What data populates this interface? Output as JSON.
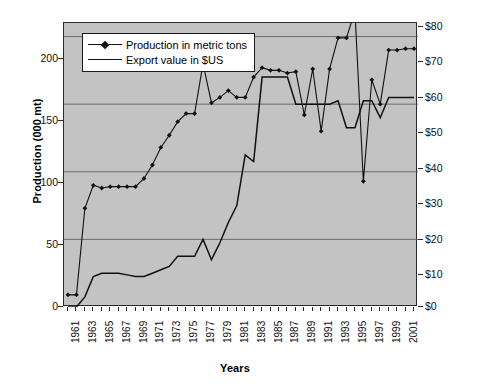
{
  "chart_data": {
    "type": "line",
    "title": "",
    "xlabel": "Years",
    "ylabel": "Production (000 mt)",
    "ylabel_right": "Export value (millions of $US)",
    "grid": true,
    "legend_position": "top-left",
    "xlim": [
      1961,
      2002
    ],
    "ylim": [
      0,
      210
    ],
    "ylim_right": [
      0,
      84
    ],
    "x": [
      1961,
      1962,
      1963,
      1964,
      1965,
      1966,
      1967,
      1968,
      1969,
      1970,
      1971,
      1972,
      1973,
      1974,
      1975,
      1976,
      1977,
      1978,
      1979,
      1980,
      1981,
      1982,
      1983,
      1984,
      1985,
      1986,
      1987,
      1988,
      1989,
      1990,
      1991,
      1992,
      1993,
      1994,
      1995,
      1996,
      1997,
      1998,
      1999,
      2000,
      2001,
      2002
    ],
    "xticks": [
      "1961",
      "1963",
      "1965",
      "1967",
      "1969",
      "1971",
      "1973",
      "1975",
      "1977",
      "1979",
      "1981",
      "1983",
      "1985",
      "1987",
      "1989",
      "1991",
      "1993",
      "1995",
      "1997",
      "1999",
      "2001"
    ],
    "yticks_left": [
      "0",
      "50",
      "100",
      "150",
      "200"
    ],
    "yticks_right": [
      "$0",
      "$10",
      "$20",
      "$30",
      "$40",
      "$50",
      "$60",
      "$70",
      "$80"
    ],
    "series": [
      {
        "name": "Production in metric tons",
        "axis": "left",
        "marker": "diamond",
        "units": "000 mt",
        "values": [
          9,
          9,
          73,
          90,
          88,
          89,
          89,
          89,
          89,
          95,
          105,
          118,
          127,
          137,
          143,
          143,
          180,
          151,
          155,
          160,
          155,
          155,
          170,
          177,
          175,
          175,
          173,
          174,
          142,
          176,
          130,
          176,
          199,
          199,
          219,
          93,
          168,
          150,
          190,
          190,
          191,
          191
        ]
      },
      {
        "name": "Export value in $US",
        "axis": "right",
        "marker": "none",
        "units": "millions of $US",
        "values": [
          0,
          0,
          3,
          9,
          10,
          10,
          10,
          9.5,
          9,
          9,
          10,
          11,
          12,
          15,
          15,
          15,
          20,
          14,
          19,
          25,
          30,
          45,
          43,
          68,
          68,
          68,
          68,
          60,
          60,
          60,
          60,
          60,
          61,
          53,
          53,
          61,
          61,
          56,
          62,
          62,
          62,
          62
        ]
      }
    ]
  },
  "legend": {
    "items": [
      {
        "label": "Production in metric tons",
        "key": "line-with-diamond-marker"
      },
      {
        "label": "Export value in $US",
        "key": "plain-line"
      }
    ]
  },
  "axes": {
    "left_title": "Production (000 mt)",
    "right_title": "Export value (millions of $US)",
    "bottom_title": "Years"
  },
  "colors": {
    "plot_background": "#c3c3c3",
    "series_line": "#111111",
    "gridline": "#555555",
    "axis": "#2b2b2b",
    "figure_background": "#ffffff"
  }
}
